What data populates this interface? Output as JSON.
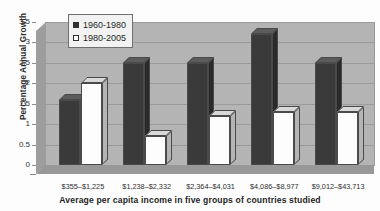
{
  "chart_data": {
    "type": "bar",
    "title": "",
    "subtitle": "",
    "xlabel": "Average per capita income in five groups of countries studied",
    "ylabel": "Percentage Annual Growth",
    "categories": [
      "$355–$1,225",
      "$1,238–$2,332",
      "$2,364–$4,031",
      "$4,086–$8,977",
      "$9,012–$43,713"
    ],
    "series": [
      {
        "name": "1960-1980",
        "values": [
          1.6,
          2.5,
          2.5,
          3.2,
          2.5
        ],
        "color": "#3a3a3a"
      },
      {
        "name": "1980-2005",
        "values": [
          2.0,
          0.7,
          1.2,
          1.3,
          1.3
        ],
        "color": "#ffffff"
      }
    ],
    "ylim": [
      0,
      3.5
    ],
    "yticks": [
      "0",
      "0.5",
      "1",
      "1.5",
      "2",
      "2.5",
      "3",
      "3.5"
    ],
    "ytick_values": [
      0,
      0.5,
      1,
      1.5,
      2,
      2.5,
      3,
      3.5
    ],
    "grid": true,
    "legend_position": "top-left-inside",
    "style": "3d-bar-grayscale"
  },
  "legend": {
    "items": [
      {
        "label": "1960-1980",
        "swatch": "filled-dark-square"
      },
      {
        "label": "1980-2005",
        "swatch": "open-white-square"
      }
    ]
  },
  "colors": {
    "series_1960_1980": "#3a3a3a",
    "series_1980_2005": "#ffffff",
    "plot_back_wall": "#b4b4b4",
    "plot_floor": "#989898",
    "gridline": "#9b9b9b",
    "page_background": "#fdfdfd"
  }
}
